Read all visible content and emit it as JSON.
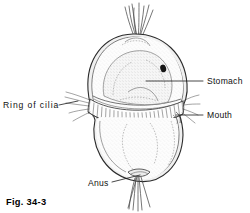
{
  "figure": {
    "number": "Fig. 34-3",
    "background_color": "#ffffff",
    "ink_color": "#1a1a1a"
  },
  "labels": [
    {
      "id": "stomach",
      "text": "Stomach",
      "side": "right",
      "x": 207,
      "y": 84,
      "leader_from": [
        203,
        81
      ],
      "leader_to": [
        146,
        81
      ]
    },
    {
      "id": "mouth",
      "text": "Mouth",
      "side": "right",
      "x": 207,
      "y": 118,
      "leader_from": [
        203,
        115
      ],
      "leader_to": [
        176,
        115
      ]
    },
    {
      "id": "ring-of-cilia",
      "text": "Ring  of  cilia",
      "side": "left",
      "x": 3,
      "y": 108,
      "leader_from": [
        59,
        105
      ],
      "leader_to": [
        78,
        101
      ]
    },
    {
      "id": "anus",
      "text": "Anus",
      "side": "bottom",
      "x": 88,
      "y": 186,
      "leader_from": [
        112,
        182
      ],
      "leader_to": [
        138,
        176
      ]
    }
  ],
  "anatomy": {
    "apical_tuft": "apical-cilia-tuft",
    "upper_hemisphere": "episphere",
    "ciliary_band": "ring-of-cilia",
    "lower_hemisphere": "hyposphere",
    "stomach_outline": "stomach",
    "eyespot": "ocellus-dark-spot",
    "mouth_opening": "mouth",
    "anal_tuft": "posterior-cilia-tuft",
    "anus_opening": "anus"
  },
  "colors": {
    "outline": "#2b2b2b",
    "inner_line": "#6e6e6e",
    "eyespot": "#161616",
    "body_fill": "#fbfbfb",
    "rim_fill": "#f0f0f0"
  }
}
